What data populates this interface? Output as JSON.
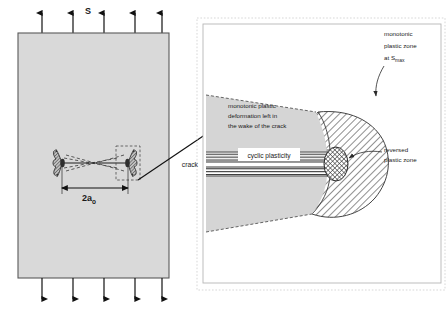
{
  "figure": {
    "colors": {
      "plate_fill": "#d9d9d9",
      "wake_fill": "#d2d2d2",
      "hatch_stroke": "#3c3c3c",
      "outline": "#4a4a4a",
      "text": "#1a1a1a",
      "panel_border": "#b4b4b4",
      "panel_dotted": "#c8c8c8",
      "arrow": "#111111"
    }
  },
  "left_panel": {
    "name": "cracked-plate-overview",
    "load_label": "S",
    "crack_length_label": "2a",
    "crack_length_subscript": "o",
    "top_arrow_count": 5,
    "bottom_arrow_count": 5,
    "plate": {
      "x": 18,
      "y": 33,
      "width": 151,
      "height": 245
    }
  },
  "right_panel": {
    "name": "crack-tip-detail",
    "labels": {
      "monotonic_zone_line1": "monotonic",
      "monotonic_zone_line2": "plastic zone",
      "monotonic_zone_line3_prefix": "at S",
      "monotonic_zone_line3_subscript": "max",
      "wake_line1": "monotonic plastic",
      "wake_line2": "deformation left in",
      "wake_line3": "the wake of the crack",
      "cyclic_plasticity": "cyclic plasticity",
      "crack": "crack",
      "reversed_zone_line1": "reversed",
      "reversed_zone_line2": "plastic zone"
    },
    "panel_box": {
      "x": 201,
      "y": 22,
      "width": 240,
      "height": 263
    }
  },
  "connector": {
    "name": "zoom-connector-arrow",
    "from_x": 138,
    "from_y": 178,
    "to_x": 220,
    "to_y": 124
  }
}
